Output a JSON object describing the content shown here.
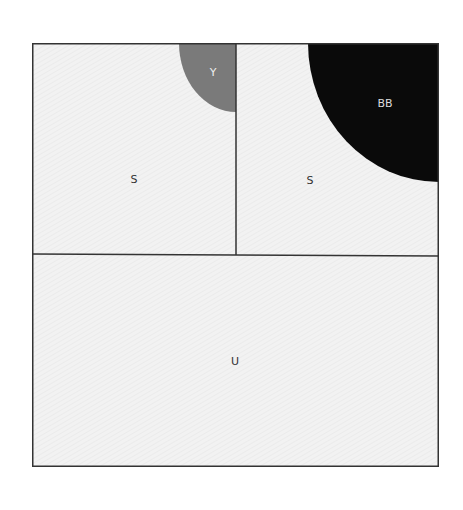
{
  "diagram": {
    "regions": [
      {
        "id": "top-left",
        "label": "S",
        "fill": "#f1f1f1"
      },
      {
        "id": "top-right",
        "label": "S",
        "fill": "#f1f1f1"
      },
      {
        "id": "bottom",
        "label": "U",
        "fill": "#f1f1f1"
      }
    ],
    "corner_shapes": [
      {
        "id": "small-quarter-circle",
        "label": "Y",
        "fill": "#7a7a7a"
      },
      {
        "id": "large-quarter-circle",
        "label": "BB",
        "fill": "#0a0a0a"
      }
    ],
    "line_color": "#333333"
  }
}
